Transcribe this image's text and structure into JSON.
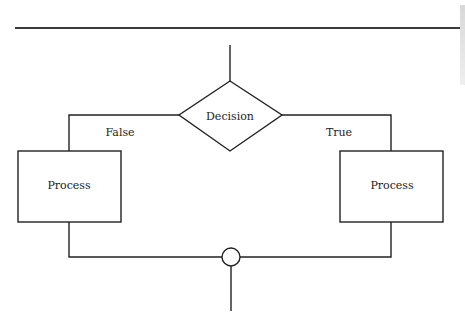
{
  "diagram": {
    "type": "flowchart",
    "decision": {
      "label": "Decision"
    },
    "branches": {
      "false": {
        "label": "False",
        "process_label": "Process"
      },
      "true": {
        "label": "True",
        "process_label": "Process"
      }
    },
    "merge": {
      "shape": "circle"
    },
    "colors": {
      "stroke": "#222222",
      "background": "#ffffff"
    }
  }
}
